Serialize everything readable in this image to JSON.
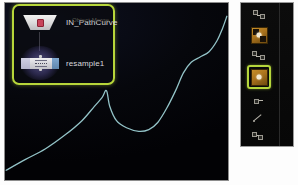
{
  "app": {
    "panel_title": "Network Editor Viewport",
    "background_color": "#050608",
    "selection_color": "#b7d63a",
    "curve_color": "#9fd4d8"
  },
  "nodes": {
    "selection_box_label": "selected-nodes-group",
    "items": [
      {
        "id": "node-objectmerge",
        "type_label": "Object Merge",
        "name": "IN_PathCurve",
        "shape": "trapezoid",
        "glyph": "merge-glyph-icon",
        "selected": false
      },
      {
        "id": "node-resample",
        "type_label": "",
        "name": "resample1",
        "shape": "rect",
        "glyph": "resample-glyph-icon",
        "selected": true
      }
    ],
    "connector": "wire-objectmerge-to-resample"
  },
  "viewport": {
    "curve_name": "path-curve-display"
  },
  "toolbar": {
    "name": "tool-shelf",
    "items": [
      {
        "id": "tool-1",
        "icon": "node-chain-icon",
        "label": "",
        "selected": false,
        "kind": "mini"
      },
      {
        "id": "tool-2",
        "icon": "textured-box-icon",
        "label": "",
        "selected": false,
        "kind": "tile-faceted"
      },
      {
        "id": "tool-3",
        "icon": "node-link-icon",
        "label": "",
        "selected": false,
        "kind": "mini"
      },
      {
        "id": "tool-4",
        "icon": "point-box-icon",
        "label": "",
        "selected": true,
        "kind": "tile"
      },
      {
        "id": "tool-5",
        "icon": "small-node-icon",
        "label": "",
        "selected": false,
        "kind": "mini"
      },
      {
        "id": "tool-6",
        "icon": "line-segment-icon",
        "label": "",
        "selected": false,
        "kind": "mini"
      },
      {
        "id": "tool-7",
        "icon": "grid-points-icon",
        "label": "",
        "selected": false,
        "kind": "mini"
      }
    ]
  },
  "chart_data": {
    "type": "line",
    "title": "",
    "xlabel": "",
    "ylabel": "",
    "grid": false,
    "legend": null,
    "series": [
      {
        "name": "path-curve",
        "color": "#9fd4d8",
        "points": [
          [
            0.005,
            0.055
          ],
          [
            0.09,
            0.115
          ],
          [
            0.18,
            0.175
          ],
          [
            0.27,
            0.255
          ],
          [
            0.345,
            0.335
          ],
          [
            0.4,
            0.415
          ],
          [
            0.435,
            0.465
          ],
          [
            0.455,
            0.505
          ],
          [
            0.47,
            0.415
          ],
          [
            0.5,
            0.335
          ],
          [
            0.545,
            0.295
          ],
          [
            0.6,
            0.275
          ],
          [
            0.645,
            0.285
          ],
          [
            0.685,
            0.325
          ],
          [
            0.725,
            0.405
          ],
          [
            0.765,
            0.505
          ],
          [
            0.8,
            0.605
          ],
          [
            0.835,
            0.665
          ],
          [
            0.875,
            0.695
          ],
          [
            0.915,
            0.725
          ],
          [
            0.95,
            0.785
          ],
          [
            0.975,
            0.855
          ],
          [
            0.995,
            0.925
          ]
        ]
      }
    ],
    "xlim": [
      0,
      1
    ],
    "ylim": [
      0,
      1
    ]
  }
}
